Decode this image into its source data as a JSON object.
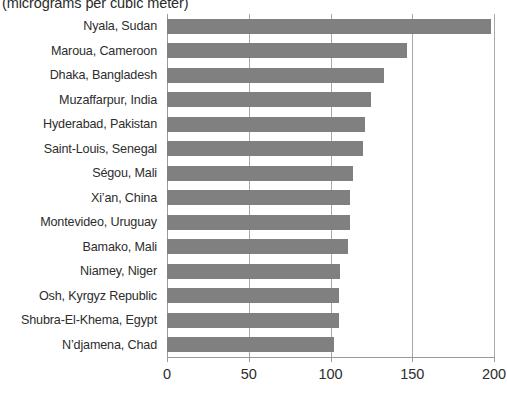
{
  "chart_data": {
    "type": "bar",
    "orientation": "horizontal",
    "title": "(micrograms per cubic meter)",
    "xlabel": "",
    "ylabel": "",
    "xlim": [
      0,
      200
    ],
    "xticks": [
      "0",
      "50",
      "100",
      "150",
      "200"
    ],
    "xtick_values": [
      0,
      50,
      100,
      150,
      200
    ],
    "grid": "vertical",
    "legend": "none",
    "bar_color": "#808080",
    "categories": [
      "Nyala, Sudan",
      "Maroua, Cameroon",
      "Dhaka, Bangladesh",
      "Muzaffarpur, India",
      "Hyderabad, Pakistan",
      "Saint-Louis, Senegal",
      "Ségou, Mali",
      "Xi’an, China",
      "Montevideo, Uruguay",
      "Bamako, Mali",
      "Niamey, Niger",
      "Osh, Kyrgyz Republic",
      "Shubra-El-Khema, Egypt",
      "N’djamena, Chad"
    ],
    "values": [
      198,
      147,
      133,
      125,
      121,
      120,
      114,
      112,
      112,
      111,
      106,
      105,
      105,
      102
    ]
  }
}
